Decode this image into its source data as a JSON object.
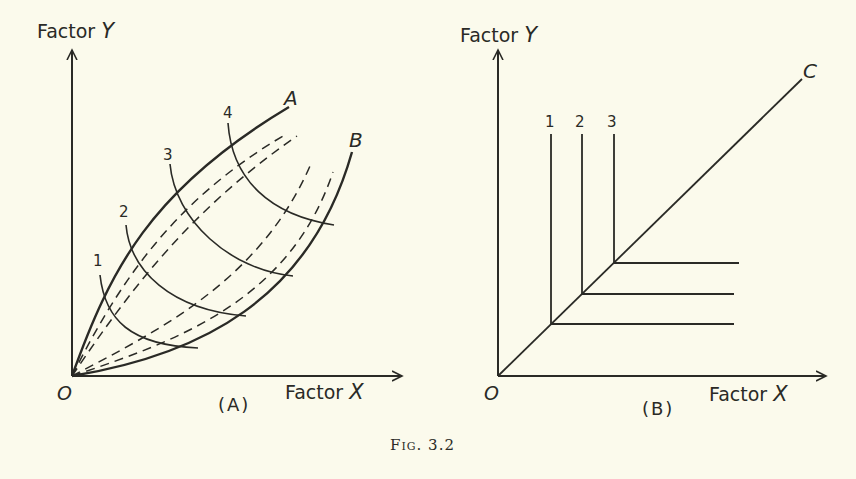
{
  "figure": {
    "caption_prefix": "Fig.",
    "caption_number": "3.2"
  },
  "panel_a": {
    "label": "(A)",
    "y_axis": {
      "text": "Factor",
      "var": "Y"
    },
    "x_axis": {
      "text": "Factor",
      "var": "X"
    },
    "origin": "O",
    "boundary_curves": [
      {
        "label": "A"
      },
      {
        "label": "B"
      }
    ],
    "isoquants": [
      {
        "label": "1"
      },
      {
        "label": "2"
      },
      {
        "label": "3"
      },
      {
        "label": "4"
      }
    ],
    "dashed_curve_count": 4
  },
  "panel_b": {
    "label": "(B)",
    "y_axis": {
      "text": "Factor",
      "var": "Y"
    },
    "x_axis": {
      "text": "Factor",
      "var": "X"
    },
    "origin": "O",
    "ray": {
      "label": "C"
    },
    "isoquants": [
      {
        "label": "1"
      },
      {
        "label": "2"
      },
      {
        "label": "3"
      }
    ]
  },
  "colors": {
    "background": "#fbfaec",
    "ink": "#2a2a26"
  }
}
